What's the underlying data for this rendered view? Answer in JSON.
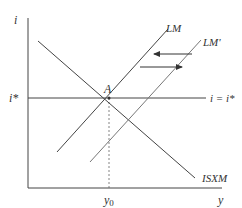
{
  "diagram": {
    "title": "",
    "axes": {
      "y_label": "i",
      "x_label": "y"
    },
    "labels": {
      "istar_left": "i*",
      "istar_right": "i = i*",
      "point_A": "A",
      "lm": "LM",
      "lm_prime": "LM'",
      "isxm": "ISXM",
      "y0": "y",
      "y0_sub": "0"
    },
    "colors": {
      "line": "#333333",
      "dashed": "#666666",
      "background": "#ffffff"
    }
  }
}
